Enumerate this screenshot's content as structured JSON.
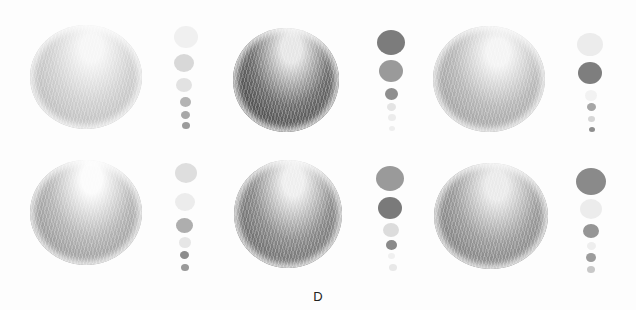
{
  "figure": {
    "label": "D"
  },
  "spheres": [
    {
      "id": "r1c1",
      "x": 30,
      "y": 25,
      "w": 112,
      "h": 104,
      "light": "#f6f6f6",
      "mid": "#d0d0d0",
      "dark": "#b6b6b6",
      "hx": "55%",
      "hy": "22%"
    },
    {
      "id": "r1c2",
      "x": 233,
      "y": 28,
      "w": 106,
      "h": 104,
      "light": "#e6e6e6",
      "mid": "#6e6e6e",
      "dark": "#3e3e3e",
      "hx": "55%",
      "hy": "20%"
    },
    {
      "id": "r1c3",
      "x": 433,
      "y": 26,
      "w": 112,
      "h": 106,
      "light": "#f4f4f4",
      "mid": "#b8b8b8",
      "dark": "#9a9a9a",
      "hx": "58%",
      "hy": "25%"
    },
    {
      "id": "r2c1",
      "x": 30,
      "y": 160,
      "w": 112,
      "h": 105,
      "light": "#fbfbfb",
      "mid": "#b6b6b6",
      "dark": "#8e8e8e",
      "hx": "55%",
      "hy": "18%"
    },
    {
      "id": "r2c2",
      "x": 234,
      "y": 160,
      "w": 108,
      "h": 108,
      "light": "#eeeeee",
      "mid": "#8c8c8c",
      "dark": "#5e5e5e",
      "hx": "55%",
      "hy": "20%"
    },
    {
      "id": "r2c3",
      "x": 434,
      "y": 163,
      "w": 114,
      "h": 106,
      "light": "#eaeaea",
      "mid": "#9c9c9c",
      "dark": "#767676",
      "hx": "55%",
      "hy": "22%"
    }
  ],
  "swatches": [
    {
      "col": "r1c1",
      "items": [
        {
          "x": 174,
          "y": 26,
          "s": 24,
          "c": "#f0f0f0"
        },
        {
          "x": 174,
          "y": 54,
          "s": 20,
          "c": "#d8d8d8"
        },
        {
          "x": 176,
          "y": 78,
          "s": 16,
          "c": "#e2e2e2"
        },
        {
          "x": 180,
          "y": 97,
          "s": 11,
          "c": "#b4b4b4"
        },
        {
          "x": 181,
          "y": 111,
          "s": 9,
          "c": "#a8a8a8"
        },
        {
          "x": 182,
          "y": 122,
          "s": 8,
          "c": "#9c9c9c"
        }
      ]
    },
    {
      "col": "r1c2",
      "items": [
        {
          "x": 377,
          "y": 30,
          "s": 28,
          "c": "#7c7c7c"
        },
        {
          "x": 379,
          "y": 60,
          "s": 24,
          "c": "#9a9a9a"
        },
        {
          "x": 385,
          "y": 88,
          "s": 13,
          "c": "#8e8e8e"
        },
        {
          "x": 387,
          "y": 103,
          "s": 9,
          "c": "#e4e4e4"
        },
        {
          "x": 388,
          "y": 114,
          "s": 8,
          "c": "#ececec"
        },
        {
          "x": 389,
          "y": 126,
          "s": 6,
          "c": "#eeeeee"
        }
      ]
    },
    {
      "col": "r1c3",
      "items": [
        {
          "x": 577,
          "y": 33,
          "s": 26,
          "c": "#ececec"
        },
        {
          "x": 578,
          "y": 62,
          "s": 24,
          "c": "#7e7e7e"
        },
        {
          "x": 585,
          "y": 90,
          "s": 12,
          "c": "#f2f2f2"
        },
        {
          "x": 587,
          "y": 103,
          "s": 9,
          "c": "#a6a6a6"
        },
        {
          "x": 588,
          "y": 116,
          "s": 7,
          "c": "#d6d6d6"
        },
        {
          "x": 589,
          "y": 127,
          "s": 6,
          "c": "#8e8e8e"
        }
      ]
    },
    {
      "col": "r2c1",
      "items": [
        {
          "x": 175,
          "y": 163,
          "s": 22,
          "c": "#dedede"
        },
        {
          "x": 175,
          "y": 193,
          "s": 20,
          "c": "#ececec"
        },
        {
          "x": 176,
          "y": 218,
          "s": 17,
          "c": "#aeaeae"
        },
        {
          "x": 179,
          "y": 237,
          "s": 12,
          "c": "#e6e6e6"
        },
        {
          "x": 180,
          "y": 251,
          "s": 9,
          "c": "#8c8c8c"
        },
        {
          "x": 181,
          "y": 264,
          "s": 8,
          "c": "#9a9a9a"
        }
      ]
    },
    {
      "col": "r2c2",
      "items": [
        {
          "x": 376,
          "y": 166,
          "s": 28,
          "c": "#9a9a9a"
        },
        {
          "x": 378,
          "y": 197,
          "s": 24,
          "c": "#7a7a7a"
        },
        {
          "x": 383,
          "y": 223,
          "s": 16,
          "c": "#dcdcdc"
        },
        {
          "x": 386,
          "y": 240,
          "s": 11,
          "c": "#8a8a8a"
        },
        {
          "x": 388,
          "y": 253,
          "s": 7,
          "c": "#f0f0f0"
        },
        {
          "x": 389,
          "y": 264,
          "s": 8,
          "c": "#e8e8e8"
        }
      ]
    },
    {
      "col": "r2c3",
      "items": [
        {
          "x": 576,
          "y": 168,
          "s": 30,
          "c": "#8a8a8a"
        },
        {
          "x": 580,
          "y": 199,
          "s": 22,
          "c": "#ececec"
        },
        {
          "x": 583,
          "y": 224,
          "s": 16,
          "c": "#959595"
        },
        {
          "x": 587,
          "y": 242,
          "s": 9,
          "c": "#eeeeee"
        },
        {
          "x": 586,
          "y": 253,
          "s": 10,
          "c": "#9c9c9c"
        },
        {
          "x": 587,
          "y": 266,
          "s": 8,
          "c": "#c8c8c8"
        }
      ]
    }
  ]
}
